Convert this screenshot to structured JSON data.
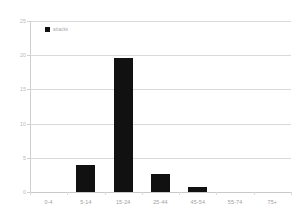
{
  "chart_data": {
    "type": "bar",
    "title": "",
    "subtitle": "",
    "xlabel": "",
    "ylabel": "",
    "categories": [
      "0-4",
      "5-14",
      "15-24",
      "25-44",
      "45-54",
      "55-74",
      "75+"
    ],
    "values": [
      0,
      3.9,
      19.6,
      2.7,
      0.8,
      0,
      0
    ],
    "series": [
      {
        "name": "attacks",
        "values": [
          0,
          3.9,
          19.6,
          2.7,
          0.8,
          0,
          0
        ]
      }
    ],
    "legend": {
      "position": "top-left",
      "entries": [
        {
          "label": "attacks",
          "color": "#111111"
        }
      ]
    },
    "ylim": [
      0,
      25
    ],
    "yticks": [
      0,
      5,
      10,
      15,
      20,
      25
    ],
    "ytick_labels": [
      "0",
      "5",
      "10",
      "15",
      "20",
      "25"
    ],
    "grid": true,
    "grid_axis": "y",
    "colors": {
      "bar": "#111111",
      "gridline": "#d9d9d9",
      "axis": "#d0d0d0",
      "tick_text": "#a8a8a8",
      "background": "#ffffff"
    }
  },
  "axes": {
    "y_labels": [
      "25",
      "20",
      "15",
      "10",
      "5",
      "0"
    ],
    "x_labels": [
      "0-4",
      "5-14",
      "15-24",
      "25-44",
      "45-54",
      "55-74",
      "75+"
    ]
  },
  "legend": {
    "swatch_name": "legend-color-swatch",
    "label": "attacks"
  }
}
